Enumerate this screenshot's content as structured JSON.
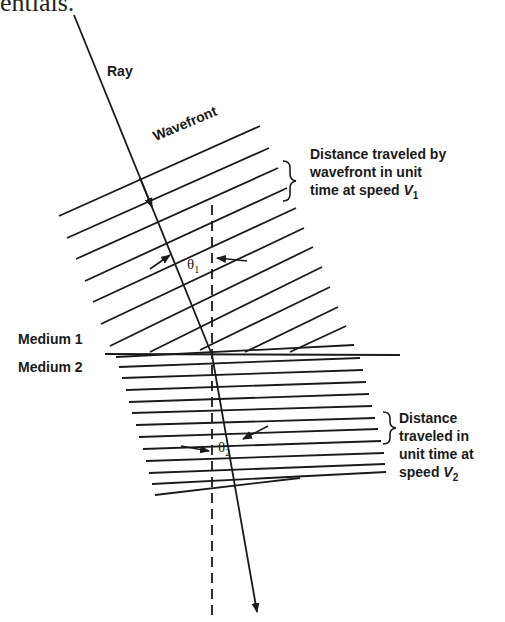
{
  "fragment_text": "entials.",
  "labels": {
    "ray": "Ray",
    "wavefront": "Wavefront",
    "medium1": "Medium 1",
    "medium2": "Medium 2",
    "theta1_symbol": "θ",
    "theta1_sub": "1",
    "theta2_symbol": "θ",
    "theta2_sub": "2"
  },
  "annotation_v1": {
    "line1": "Distance traveled by",
    "line2": "wavefront in unit",
    "line3_prefix": "time at speed ",
    "speed_symbol": "V",
    "speed_sub": "1"
  },
  "annotation_v2": {
    "line1": "Distance",
    "line2": "traveled in",
    "line3": "unit time at",
    "line4_prefix": "speed ",
    "speed_symbol": "V",
    "speed_sub": "2"
  },
  "colors": {
    "ink": "#1a1a1a",
    "background": "#ffffff"
  }
}
